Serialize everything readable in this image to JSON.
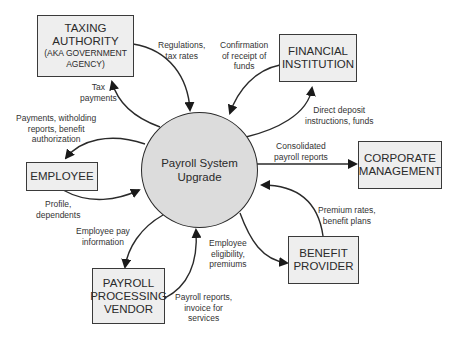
{
  "diagram": {
    "type": "context data flow diagram",
    "process": {
      "label_line1": "Payroll System",
      "label_line2": "Upgrade"
    },
    "entities": {
      "taxing_authority": {
        "line1": "TAXING",
        "line2": "AUTHORITY",
        "sub1": "(AKA GOVERNMENT",
        "sub2": "AGENCY)"
      },
      "financial_institution": {
        "line1": "FINANCIAL",
        "line2": "INSTITUTION"
      },
      "employee": {
        "line1": "EMPLOYEE"
      },
      "corporate_management": {
        "line1": "CORPORATE",
        "line2": "MANAGEMENT"
      },
      "benefit_provider": {
        "line1": "BENEFIT",
        "line2": "PROVIDER"
      },
      "payroll_vendor": {
        "line1": "PAYROLL",
        "line2": "PROCESSING",
        "line3": "VENDOR"
      }
    },
    "flows": {
      "regulations": {
        "line1": "Regulations,",
        "line2": "tax rates"
      },
      "tax_payments": {
        "line1": "Tax",
        "line2": "payments"
      },
      "confirmation": {
        "line1": "Confirmation",
        "line2": "of receipt of",
        "line3": "funds"
      },
      "direct_deposit": {
        "line1": "Direct deposit",
        "line2": "instructions, funds"
      },
      "payments_to_employee": {
        "line1": "Payments, witholding",
        "line2": "reports, benefit",
        "line3": "authorization"
      },
      "profile": {
        "line1": "Profile,",
        "line2": "dependents"
      },
      "consolidated": {
        "line1": "Consolidated",
        "line2": "payroll reports"
      },
      "premium_rates": {
        "line1": "Premium rates,",
        "line2": "benefit plans"
      },
      "employee_pay_info": {
        "line1": "Employee pay",
        "line2": "information"
      },
      "eligibility": {
        "line1": "Employee",
        "line2": "eligibility,",
        "line3": "premiums"
      },
      "payroll_reports": {
        "line1": "Payroll reports,",
        "line2": "invoice for",
        "line3": "services"
      }
    },
    "colors": {
      "box_fill": "#eeeeee",
      "circle_fill": "#dcdcdc",
      "stroke": "#2a2a2a"
    }
  }
}
